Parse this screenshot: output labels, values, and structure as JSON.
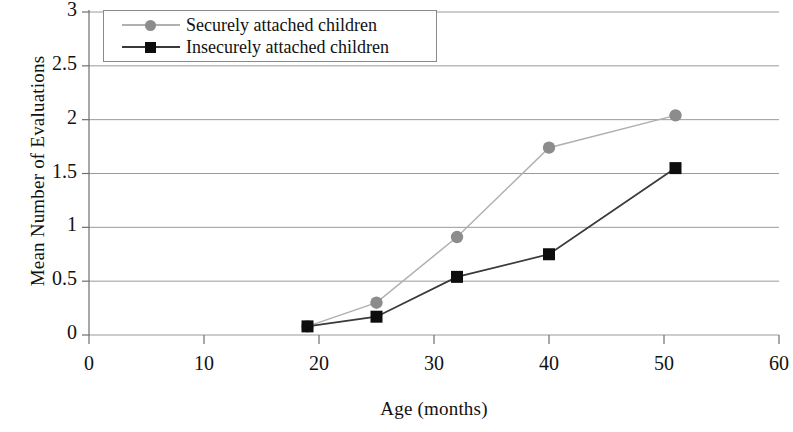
{
  "chart_data": {
    "type": "line",
    "title": "",
    "xlabel": "Age (months)",
    "ylabel": "Mean Number of Evaluations",
    "xlim": [
      0,
      60
    ],
    "ylim": [
      0,
      3
    ],
    "xticks": [
      "0",
      "10",
      "20",
      "30",
      "40",
      "50",
      "60"
    ],
    "yticks": [
      "0",
      "0.5",
      "1",
      "1.5",
      "2",
      "2.5",
      "3"
    ],
    "grid": "horizontal",
    "legend_position": "top-left",
    "series": [
      {
        "name": "Securely attached children",
        "marker": "circle",
        "color": "#8c8c8c",
        "line_color": "#b0b0b0",
        "x": [
          19,
          25,
          32,
          40,
          51
        ],
        "values": [
          0.08,
          0.3,
          0.91,
          1.74,
          2.04
        ]
      },
      {
        "name": "Insecurely attached children",
        "marker": "square",
        "color": "#0d0d0d",
        "line_color": "#3a3a3a",
        "x": [
          19,
          25,
          32,
          40,
          51
        ],
        "values": [
          0.08,
          0.17,
          0.54,
          0.75,
          1.55
        ]
      }
    ]
  },
  "legend": {
    "entries": [
      {
        "label": "Securely attached children"
      },
      {
        "label": "Insecurely attached children"
      }
    ]
  },
  "axes": {
    "y_title": "Mean Number of Evaluations",
    "x_title": "Age (months)",
    "y_tick_labels": [
      "3",
      "2.5",
      "2",
      "1.5",
      "1",
      "0.5",
      "0"
    ],
    "x_tick_labels": [
      "0",
      "10",
      "20",
      "30",
      "40",
      "50",
      "60"
    ]
  },
  "colors": {
    "grid": "#9a9a9a",
    "axis": "#6e6e6e",
    "secure": "#8c8c8c",
    "insecure": "#0d0d0d",
    "background": "#ffffff"
  }
}
